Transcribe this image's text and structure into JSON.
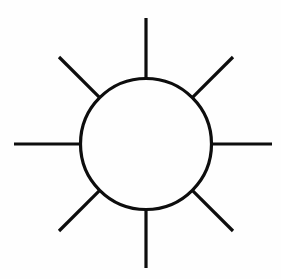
{
  "figure": {
    "canvas": {
      "width": 281,
      "height": 279,
      "background": "#fefefe"
    },
    "stroke": {
      "color": "#0d0d0d",
      "width": 3.2,
      "linecap": "butt"
    },
    "circle": {
      "cx": 146,
      "cy": 144,
      "r": 65.5,
      "fill": "none"
    },
    "rays": [
      {
        "name": "ray-north",
        "angle_deg": 270,
        "inner_radius": 65.5,
        "outer_radius": 126,
        "x1": 146,
        "y1": 78.5,
        "x2": 146,
        "y2": 18
      },
      {
        "name": "ray-northeast",
        "angle_deg": 315,
        "inner_radius": 65.5,
        "outer_radius": 123,
        "x1": 192.3,
        "y1": 97.7,
        "x2": 233,
        "y2": 57
      },
      {
        "name": "ray-east",
        "angle_deg": 0,
        "inner_radius": 65.5,
        "outer_radius": 126,
        "x1": 211.5,
        "y1": 144,
        "x2": 272,
        "y2": 144
      },
      {
        "name": "ray-southeast",
        "angle_deg": 45,
        "inner_radius": 65.5,
        "outer_radius": 123,
        "x1": 192.3,
        "y1": 190.3,
        "x2": 233,
        "y2": 231
      },
      {
        "name": "ray-south",
        "angle_deg": 90,
        "inner_radius": 65.5,
        "outer_radius": 124,
        "x1": 146,
        "y1": 209.5,
        "x2": 146,
        "y2": 268
      },
      {
        "name": "ray-southwest",
        "angle_deg": 135,
        "inner_radius": 65.5,
        "outer_radius": 123,
        "x1": 99.7,
        "y1": 190.3,
        "x2": 59,
        "y2": 231
      },
      {
        "name": "ray-west",
        "angle_deg": 180,
        "inner_radius": 65.5,
        "outer_radius": 132,
        "x1": 80.5,
        "y1": 144,
        "x2": 14,
        "y2": 144
      },
      {
        "name": "ray-northwest",
        "angle_deg": 225,
        "inner_radius": 65.5,
        "outer_radius": 123,
        "x1": 99.7,
        "y1": 97.7,
        "x2": 59,
        "y2": 57
      }
    ]
  }
}
